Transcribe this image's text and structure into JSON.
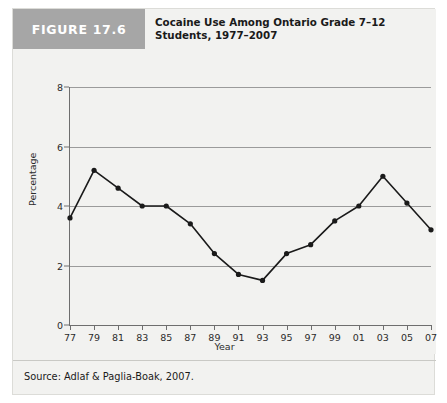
{
  "figure": {
    "badge_label": "FIGURE 17.6",
    "title": "Cocaine Use Among Ontario Grade 7–12 Students, 1977–2007",
    "source": "Source: Adlaf & Paglia-Boak, 2007.",
    "badge_color": "#a6a6a6",
    "card_background": "#f2f2f0",
    "line_color": "#1a1a1a",
    "gridline_color": "#9b9b9b"
  },
  "chart_data": {
    "type": "line",
    "title": "Cocaine Use Among Ontario Grade 7–12 Students, 1977–2007",
    "xlabel": "Year",
    "ylabel": "Percentage",
    "categories": [
      "77",
      "79",
      "81",
      "83",
      "85",
      "87",
      "89",
      "91",
      "93",
      "95",
      "97",
      "99",
      "01",
      "03",
      "05",
      "07"
    ],
    "values": [
      3.6,
      5.2,
      4.6,
      4.0,
      4.0,
      3.4,
      2.4,
      1.7,
      1.5,
      2.4,
      2.7,
      3.5,
      4.0,
      5.0,
      4.1,
      3.2
    ],
    "ylim": [
      0,
      8
    ],
    "yticks": [
      0,
      2,
      4,
      6,
      8
    ],
    "ytick_labels": [
      "0",
      "2",
      "4",
      "6",
      "8"
    ],
    "grid": true,
    "grid_axis": "y",
    "legend": false,
    "markers": true,
    "marker_shape": "circle"
  }
}
